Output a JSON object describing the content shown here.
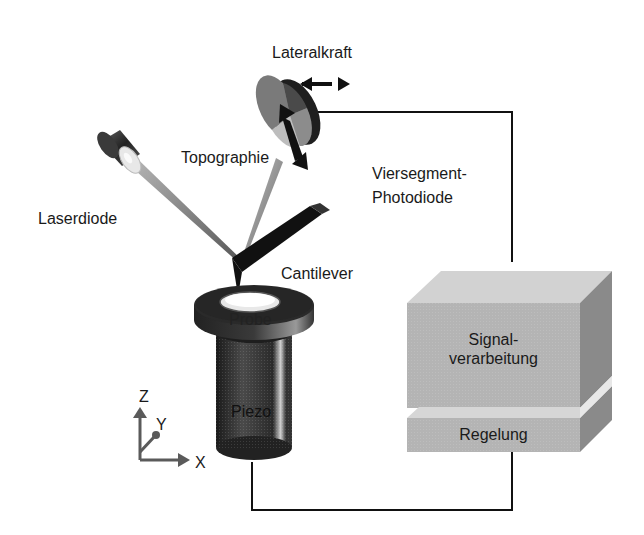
{
  "diagram": {
    "title": "",
    "components": {
      "laser_diode": {
        "label": "Laserdiode"
      },
      "photodiode": {
        "label_line1": "Viersegment-",
        "label_line2": "Photodiode"
      },
      "lateral_force": {
        "label": "Lateralkraft"
      },
      "topography": {
        "label": "Topographie"
      },
      "cantilever": {
        "label": "Cantilever"
      },
      "sample": {
        "label": "Probe"
      },
      "piezo": {
        "label": "Piezo"
      },
      "signal_processing": {
        "label_line1": "Signal-",
        "label_line2": "verarbeitung"
      },
      "control": {
        "label": "Regelung"
      }
    },
    "axes": {
      "z": "Z",
      "y": "Y",
      "x": "X"
    },
    "colors": {
      "line": "#111111",
      "box_front": "#b4b4b4",
      "box_top": "#d2d2d2",
      "box_side": "#8a8a8a",
      "piezo_dark": "#2a2a2a",
      "axis_arrow": "#5a5a5a"
    }
  }
}
